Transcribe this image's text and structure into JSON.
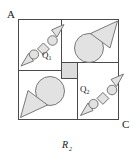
{
  "figure": {
    "caption": "R",
    "caption_subscript": "2",
    "corner_labels": {
      "top_left": "A",
      "bottom_right": "C"
    },
    "quadrant_labels": [
      {
        "base": "Q",
        "sub": "1"
      },
      {
        "base": "Q",
        "sub": "2"
      }
    ],
    "colors": {
      "stroke": "#4a4a4a",
      "shape_fill": "#e2e2e2",
      "shape_stroke": "#6b6b6b",
      "center_fill": "#dcdcdc",
      "background": "#ffffff",
      "text": "#1a1a1a"
    },
    "geometry": {
      "outer_square": {
        "x": 18,
        "y": 19,
        "width": 101,
        "height": 101
      },
      "center_square": {
        "x": 61,
        "y": 62,
        "width": 16,
        "height": 16
      },
      "divider_x": 69,
      "divider_y": 70
    },
    "quadrants": [
      {
        "name": "top-left",
        "label": "Q1",
        "contents": [
          "arrow-head",
          "circle",
          "square",
          "circle",
          "arrow-head"
        ],
        "pattern": "diagonal-chain"
      },
      {
        "name": "top-right",
        "label": "",
        "contents": [
          "large-circle",
          "large-triangle"
        ],
        "pattern": "circle-and-triangle"
      },
      {
        "name": "bottom-left",
        "label": "",
        "contents": [
          "large-circle",
          "large-triangle"
        ],
        "pattern": "circle-and-triangle"
      },
      {
        "name": "bottom-right",
        "label": "Q2",
        "contents": [
          "arrow-head",
          "circle",
          "square",
          "circle",
          "arrow-head"
        ],
        "pattern": "diagonal-chain"
      }
    ]
  }
}
